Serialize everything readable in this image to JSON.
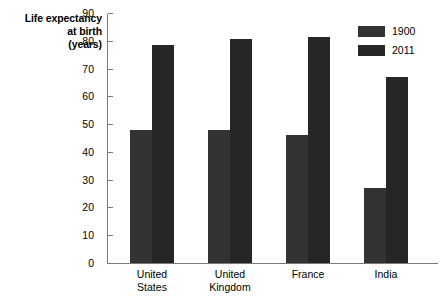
{
  "chart_data": {
    "type": "bar",
    "title": "",
    "ylabel_lines": [
      "Life expectancy",
      "at birth",
      "(years)"
    ],
    "ylabel": "Life expectancy at birth (years)",
    "xlabel": "",
    "categories": [
      "United States",
      "United Kingdom",
      "France",
      "India"
    ],
    "category_lines": [
      [
        "United",
        "States"
      ],
      [
        "United",
        "Kingdom"
      ],
      [
        "France"
      ],
      [
        "India"
      ]
    ],
    "series": [
      {
        "name": "1900",
        "color": "#333333",
        "values": [
          48,
          48,
          46,
          27
        ]
      },
      {
        "name": "2011",
        "color": "#262626",
        "values": [
          78.5,
          80.5,
          81.5,
          67
        ]
      }
    ],
    "ylim": [
      0,
      90
    ],
    "ytick_step": 10,
    "ytick_labels": [
      "90",
      "80",
      "70",
      "60",
      "50",
      "40",
      "30",
      "20",
      "10",
      "0"
    ],
    "ytick_values": [
      90,
      80,
      70,
      60,
      50,
      40,
      30,
      20,
      10,
      0
    ],
    "grid": false,
    "legend_position": "top-right",
    "axis_color": "#7a7a7a",
    "background": "#ffffff"
  }
}
